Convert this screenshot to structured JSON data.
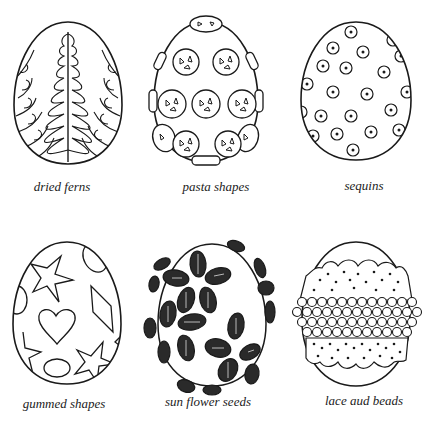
{
  "colors": {
    "ink": "#1a1a1a",
    "paper": "#ffffff"
  },
  "eggs": [
    {
      "id": "dried-ferns",
      "label": "dried ferns"
    },
    {
      "id": "pasta-shapes",
      "label": "pasta shapes"
    },
    {
      "id": "sequins",
      "label": "sequins"
    },
    {
      "id": "gummed-shapes",
      "label": "gummed shapes"
    },
    {
      "id": "sun-flower-seeds",
      "label": "sun flower seeds"
    },
    {
      "id": "lace-and-beads",
      "label": "lace aud beads"
    }
  ]
}
